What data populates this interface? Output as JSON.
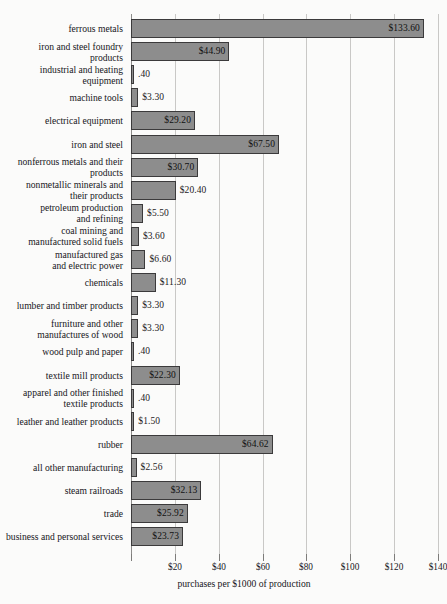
{
  "chart_data": {
    "type": "bar",
    "orientation": "horizontal",
    "title": "",
    "xlabel": "purchases per $1000 of production",
    "ylabel": "",
    "xlim": [
      0,
      140
    ],
    "grid": true,
    "legend": "none",
    "xticks": [
      20,
      40,
      60,
      80,
      100,
      120,
      140
    ],
    "xtick_labels": [
      "$20",
      "$40",
      "$60",
      "$80",
      "$100",
      "$120",
      "$140"
    ],
    "categories": [
      "ferrous metals",
      "iron and steel foundry\nproducts",
      "industrial and heating\nequipment",
      "machine tools",
      "electrical equipment",
      "iron and steel",
      "nonferrous metals and their\nproducts",
      "nonmetallic minerals and\ntheir products",
      "petroleum production\nand refining",
      "coal mining and\nmanufactured solid fuels",
      "manufactured gas\nand electric power",
      "chemicals",
      "lumber and timber products",
      "furniture and other\nmanufactures of wood",
      "wood pulp and paper",
      "textile mill products",
      "apparel and other finished\ntextile products",
      "leather and leather products",
      "rubber",
      "all other manufacturing",
      "steam railroads",
      "trade",
      "business and personal services"
    ],
    "values": [
      133.6,
      44.9,
      0.4,
      3.3,
      29.2,
      67.5,
      30.7,
      20.4,
      5.5,
      3.6,
      6.6,
      11.3,
      3.3,
      3.3,
      0.4,
      22.3,
      0.4,
      1.5,
      64.62,
      2.56,
      32.13,
      25.92,
      23.73
    ],
    "value_labels": [
      "$133.60",
      "$44.90",
      ".40",
      "$3.30",
      "$29.20",
      "$67.50",
      "$30.70",
      "$20.40",
      "$5.50",
      "$3.60",
      "$6.60",
      "$11.30",
      "$3.30",
      "$3.30",
      ".40",
      "$22.30",
      ".40",
      "$1.50",
      "$64.62",
      "$2.56",
      "$32.13",
      "$25.92",
      "$23.73"
    ],
    "colors": {
      "bar_fill": "#8d8d8d",
      "bar_border": "#3b3a3b",
      "background": "#fbfbfa",
      "gridline": "#c9c8c6",
      "axis": "#8d8c8a",
      "text": "#17161a"
    }
  }
}
